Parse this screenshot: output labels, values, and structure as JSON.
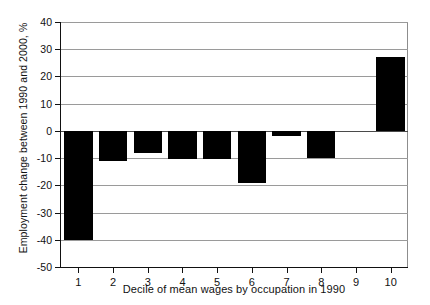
{
  "chart_data": {
    "type": "bar",
    "title": "",
    "xlabel": "Decile of mean wages by occupation in 1990",
    "ylabel": "Employment change between 1990 and 2000, %",
    "categories": [
      "1",
      "2",
      "3",
      "4",
      "5",
      "6",
      "7",
      "8",
      "9",
      "10"
    ],
    "values": [
      -40,
      -11,
      -8,
      -10.5,
      -10.5,
      -19,
      -2,
      -10,
      0,
      27
    ],
    "ylim": [
      -50,
      40
    ],
    "ytick_labels": [
      "40",
      "30",
      "20",
      "10",
      "0",
      "-10",
      "-20",
      "-30",
      "-40",
      "-50"
    ],
    "ytick_values": [
      40,
      30,
      20,
      10,
      0,
      -10,
      -20,
      -30,
      -40,
      -50
    ],
    "grid": true,
    "grid_axis": "y",
    "legend": "none",
    "bar_color": "#000000",
    "axis_color": "#111111",
    "grid_color": "#9a9a9a"
  }
}
